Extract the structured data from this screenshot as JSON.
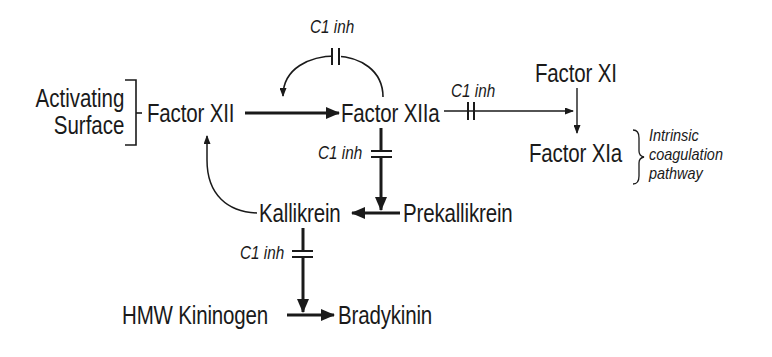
{
  "diagram": {
    "nodes": {
      "activating_surface_line1": "Activating",
      "activating_surface_line2": "Surface",
      "factor_xii": "Factor XII",
      "factor_xiia": "Factor XIIa",
      "factor_xi": "Factor XI",
      "factor_xia": "Factor XIa",
      "kallikrein": "Kallikrein",
      "prekallikrein": "Prekallikrein",
      "hmw_kininogen": "HMW Kininogen",
      "bradykinin": "Bradykinin"
    },
    "inhibitor_labels": {
      "top_loop": "C1 inh",
      "xiia_to_xi": "C1 inh",
      "xiia_to_prekallikrein": "C1 inh",
      "kallikrein_to_kininogen": "C1 inh"
    },
    "annotation": {
      "line1": "Intrinsic",
      "line2": "coagulation",
      "line3": "pathway"
    },
    "edges": [
      {
        "from": "Activating Surface",
        "to": "Factor XII",
        "type": "bracket"
      },
      {
        "from": "Factor XII",
        "to": "Factor XIIa",
        "type": "activation",
        "weight": "thick"
      },
      {
        "from": "Factor XIIa",
        "to": "Factor XII->XIIa",
        "type": "feedback",
        "inhibited_by": "C1 inh"
      },
      {
        "from": "Factor XIIa",
        "to": "Factor XI->XIa",
        "type": "activation",
        "inhibited_by": "C1 inh"
      },
      {
        "from": "Factor XI",
        "to": "Factor XIa",
        "type": "conversion"
      },
      {
        "from": "Factor XIIa",
        "to": "Prekallikrein->Kallikrein",
        "type": "activation",
        "weight": "thick",
        "inhibited_by": "C1 inh"
      },
      {
        "from": "Prekallikrein",
        "to": "Kallikrein",
        "type": "conversion",
        "weight": "thick"
      },
      {
        "from": "Kallikrein",
        "to": "Factor XII",
        "type": "feedback"
      },
      {
        "from": "Kallikrein",
        "to": "HMW Kininogen->Bradykinin",
        "type": "activation",
        "weight": "thick",
        "inhibited_by": "C1 inh"
      },
      {
        "from": "HMW Kininogen",
        "to": "Bradykinin",
        "type": "conversion",
        "weight": "thick"
      }
    ],
    "colors": {
      "ink": "#1a1a1a",
      "background": "#ffffff"
    }
  }
}
